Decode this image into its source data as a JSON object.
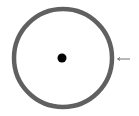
{
  "diagram": {
    "circle": {
      "cx": 63,
      "cy": 58,
      "r": 49,
      "stroke": "#606060",
      "stroke_width": 4.5,
      "fill": "#ffffff"
    },
    "center_dot": {
      "cx": 62,
      "cy": 58,
      "r": 4.5,
      "fill": "#000000"
    },
    "arrow": {
      "x1": 130,
      "x2": 117,
      "y": 59,
      "color": "#707070",
      "direction": "left"
    }
  }
}
